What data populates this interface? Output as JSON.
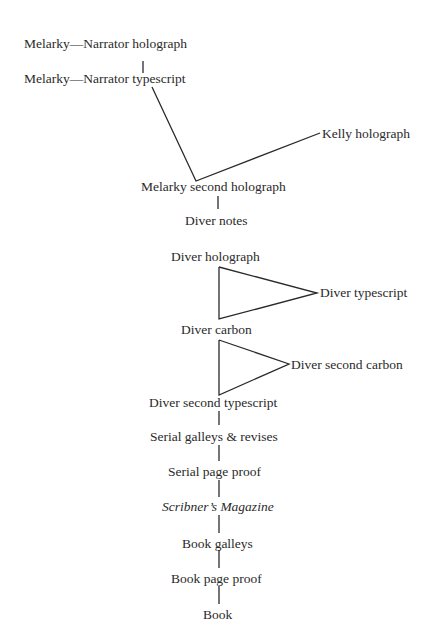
{
  "diagram": {
    "type": "manuscript-stemma",
    "nodes": {
      "melarky_narrator_holograph": "Melarky—Narrator holograph",
      "melarky_narrator_typescript": "Melarky—Narrator typescript",
      "kelly_holograph": "Kelly holograph",
      "melarky_second_holograph": "Melarky second holograph",
      "diver_notes": "Diver notes",
      "diver_holograph": "Diver holograph",
      "diver_typescript": "Diver typescript",
      "diver_carbon": "Diver carbon",
      "diver_second_carbon": "Diver second carbon",
      "diver_second_typescript": "Diver second typescript",
      "serial_galleys": "Serial galleys & revises",
      "serial_page_proof": "Serial page proof",
      "scribners_magazine": "Scribner’s Magazine",
      "book_galleys": "Book galleys",
      "book_page_proof": "Book page proof",
      "book": "Book"
    },
    "edges": [
      [
        "melarky_narrator_holograph",
        "melarky_narrator_typescript"
      ],
      [
        "melarky_narrator_typescript",
        "melarky_second_holograph"
      ],
      [
        "kelly_holograph",
        "melarky_second_holograph"
      ],
      [
        "melarky_second_holograph",
        "diver_notes"
      ],
      [
        "diver_holograph",
        "diver_typescript"
      ],
      [
        "diver_typescript",
        "diver_carbon"
      ],
      [
        "diver_holograph",
        "diver_carbon"
      ],
      [
        "diver_carbon",
        "diver_second_carbon"
      ],
      [
        "diver_second_carbon",
        "diver_second_typescript"
      ],
      [
        "diver_carbon",
        "diver_second_typescript"
      ],
      [
        "diver_second_typescript",
        "serial_galleys"
      ],
      [
        "serial_galleys",
        "serial_page_proof"
      ],
      [
        "serial_page_proof",
        "scribners_magazine"
      ],
      [
        "scribners_magazine",
        "book_galleys"
      ],
      [
        "book_galleys",
        "book_page_proof"
      ],
      [
        "book_page_proof",
        "book"
      ]
    ]
  }
}
